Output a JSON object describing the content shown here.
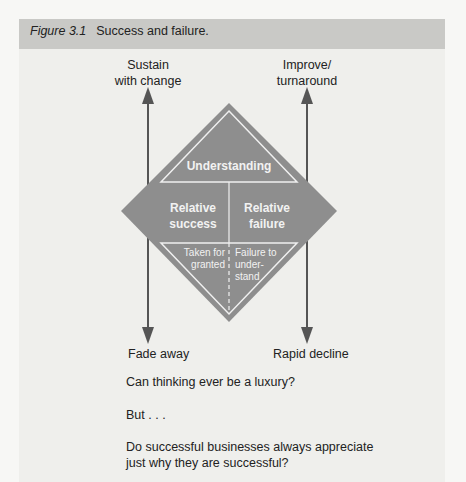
{
  "figure": {
    "number": "Figure 3.1",
    "title": "Success and failure."
  },
  "colors": {
    "diamond": "#8e8e8e",
    "arrow": "#555555",
    "caption_bar": "#c9c9c6",
    "panel": "#efefec"
  },
  "arrows": {
    "top_left": {
      "line1": "Sustain",
      "line2": "with change"
    },
    "top_right": {
      "line1": "Improve/",
      "line2": "turnaround"
    },
    "bottom_left": "Fade away",
    "bottom_right": "Rapid decline"
  },
  "diamond": {
    "top": "Understanding",
    "left": {
      "line1": "Relative",
      "line2": "success"
    },
    "right": {
      "line1": "Relative",
      "line2": "failure"
    },
    "bottom_left": {
      "line1": "Taken for",
      "line2": "granted"
    },
    "bottom_right": {
      "line1": "Failure to",
      "line2": "under-",
      "line3": "stand"
    }
  },
  "questions": {
    "q1": "Can thinking ever be a luxury?",
    "q2": "But . . .",
    "q3_line1": "Do successful businesses always appreciate",
    "q3_line2": "just why they are successful?"
  }
}
